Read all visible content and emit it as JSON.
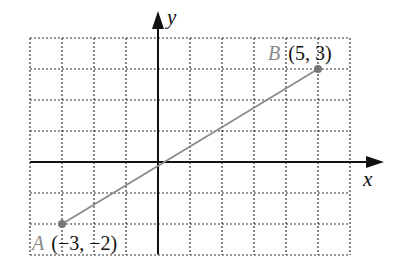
{
  "chart_data": {
    "type": "line",
    "title": "",
    "xlabel": "x",
    "ylabel": "y",
    "xlim": [
      -4,
      6
    ],
    "ylim": [
      -3,
      4
    ],
    "grid": true,
    "grid_style": "dotted",
    "points": [
      {
        "name": "A",
        "x": -3,
        "y": -2,
        "label": "(−3, −2)"
      },
      {
        "name": "B",
        "x": 5,
        "y": 3,
        "label": "(5, 3)"
      }
    ],
    "segment": {
      "from": "A",
      "to": "B"
    }
  },
  "axes": {
    "x_label": "x",
    "y_label": "y"
  },
  "point_a": {
    "name": "A",
    "coords": "(−3, −2)"
  },
  "point_b": {
    "name": "B",
    "coords": "(5, 3)"
  },
  "colors": {
    "grid": "#333333",
    "axis": "#111111",
    "segment": "#888888",
    "point": "#777777",
    "point_name": "#888888",
    "text": "#111111"
  }
}
